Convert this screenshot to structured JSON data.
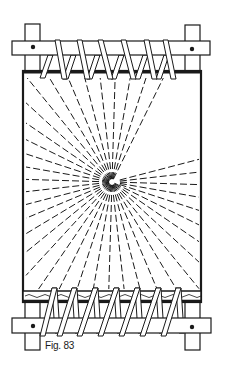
{
  "figure": {
    "caption": "Fig. 83",
    "colors": {
      "ink": "#1a1a1a",
      "paper": "#ffffff"
    },
    "center_point": [
      112,
      182
    ],
    "top_lashings": 6,
    "bottom_lashings": 7
  }
}
